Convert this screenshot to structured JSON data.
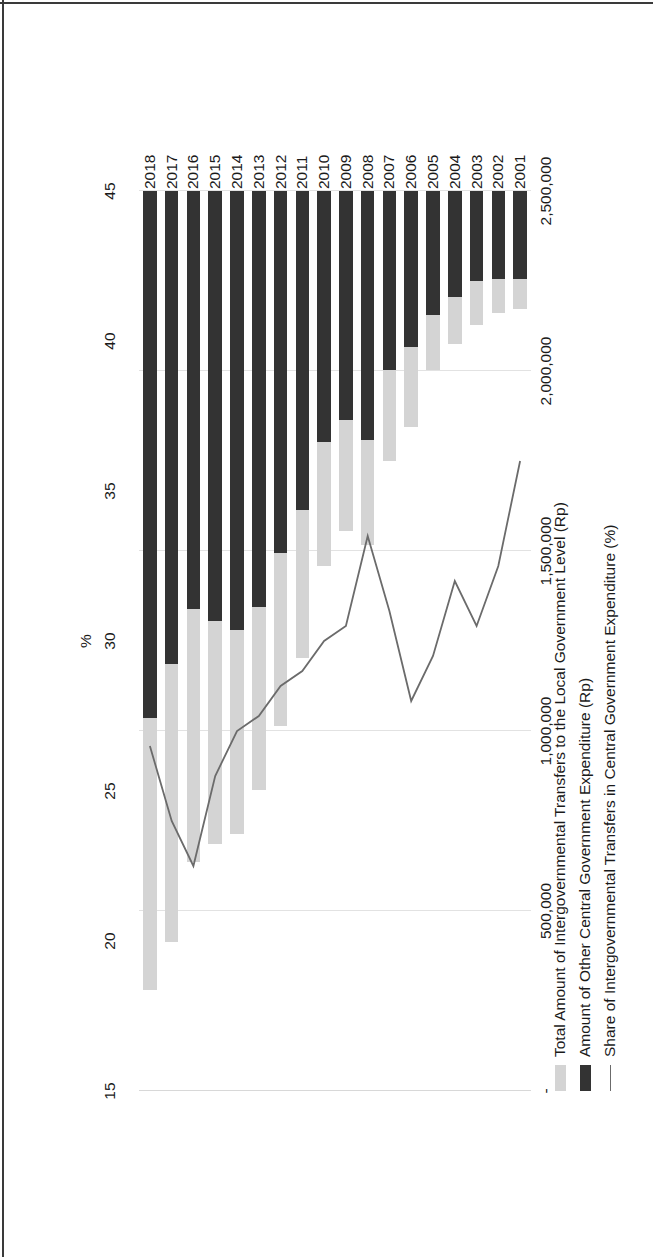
{
  "chart_data": {
    "type": "bar",
    "title": "",
    "subtitle": "",
    "orientation": "vertical-stacked-with-line",
    "categories": [
      "2001",
      "2002",
      "2003",
      "2004",
      "2005",
      "2006",
      "2007",
      "2008",
      "2009",
      "2010",
      "2011",
      "2012",
      "2013",
      "2014",
      "2015",
      "2016",
      "2017",
      "2018"
    ],
    "xlabel": "",
    "ylabel": "Rp billion",
    "y2label": "%",
    "ylim": [
      0,
      2500000
    ],
    "yticks": [
      "-",
      "500,000",
      "1,000,000",
      "1,500,000",
      "2,000,000",
      "2,500,000"
    ],
    "ytick_values": [
      0,
      500000,
      1000000,
      1500000,
      2000000,
      2500000
    ],
    "y2lim": [
      15,
      45
    ],
    "y2ticks": [
      "15",
      "20",
      "25",
      "30",
      "35",
      "40",
      "45"
    ],
    "y2tick_values": [
      15,
      20,
      25,
      30,
      35,
      40,
      45
    ],
    "grid": true,
    "legend_position": "bottom",
    "series": [
      {
        "name": "Total Amount of Intergovernmental Transfers to the Local Government Level (Rp)",
        "type": "bar-stacked",
        "color": "#d4d4d4",
        "axis": "left",
        "values": [
          83000,
          94000,
          120000,
          131000,
          153000,
          223000,
          253000,
          293000,
          309000,
          345000,
          411000,
          480000,
          510000,
          565000,
          620000,
          703000,
          770000,
          755000
        ]
      },
      {
        "name": "Amount of Other Central Government Expenditure (Rp)",
        "type": "bar-stacked",
        "color": "#333333",
        "axis": "left",
        "values": [
          245000,
          245000,
          251000,
          295000,
          345000,
          433000,
          496000,
          691000,
          635000,
          697000,
          885000,
          1005000,
          1155000,
          1220000,
          1195000,
          1162000,
          1315000,
          1465000
        ]
      },
      {
        "name": "Share of Intergovernmental Transfers in Central Government Expenditure (%)",
        "type": "line",
        "color": "#6b6b6b",
        "axis": "right",
        "values": [
          24.0,
          27.5,
          29.5,
          28.0,
          30.5,
          32.0,
          29.0,
          26.5,
          29.5,
          30.0,
          31.0,
          31.5,
          32.5,
          33.0,
          34.5,
          37.5,
          36.0,
          33.5
        ]
      }
    ]
  },
  "axes": {
    "left_title": "Rp billion",
    "right_title": "%"
  },
  "legend": {
    "items": [
      {
        "label": "Total Amount of Intergovernmental Transfers to the Local Government Level (Rp)",
        "marker": "swatch-light-gray"
      },
      {
        "label": "Amount of Other Central Government Expenditure (Rp)",
        "marker": "swatch-dark"
      },
      {
        "label": "Share of Intergovernmental Transfers in Central Government Expenditure (%)",
        "marker": "line-gray"
      }
    ]
  }
}
